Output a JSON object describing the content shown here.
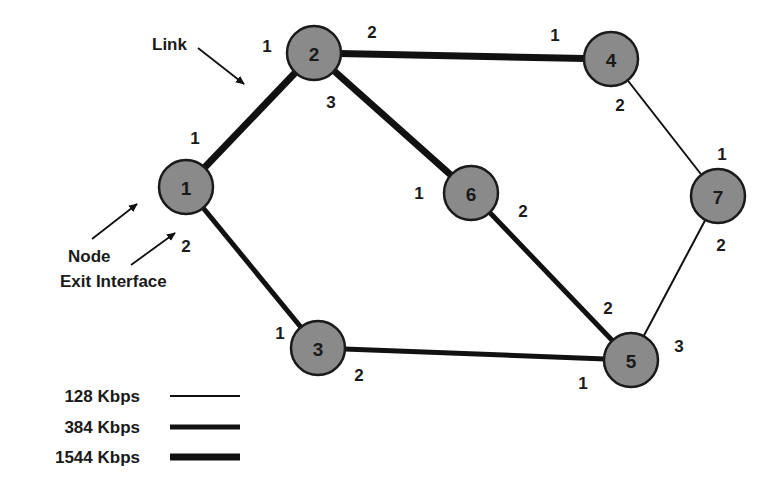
{
  "diagram": {
    "type": "network-topology",
    "nodes": [
      {
        "id": "1",
        "label": "1",
        "x": 186,
        "y": 187
      },
      {
        "id": "2",
        "label": "2",
        "x": 314,
        "y": 53
      },
      {
        "id": "3",
        "label": "3",
        "x": 318,
        "y": 348
      },
      {
        "id": "4",
        "label": "4",
        "x": 611,
        "y": 59
      },
      {
        "id": "5",
        "label": "5",
        "x": 631,
        "y": 360
      },
      {
        "id": "6",
        "label": "6",
        "x": 471,
        "y": 193
      },
      {
        "id": "7",
        "label": "7",
        "x": 718,
        "y": 196
      }
    ],
    "node_radius": 27,
    "node_fill": "#8a8a8a",
    "links": [
      {
        "from": "1",
        "to": "2",
        "bandwidth": "1544 Kbps",
        "width": 7
      },
      {
        "from": "2",
        "to": "4",
        "bandwidth": "1544 Kbps",
        "width": 7
      },
      {
        "from": "2",
        "to": "6",
        "bandwidth": "1544 Kbps",
        "width": 7
      },
      {
        "from": "1",
        "to": "3",
        "bandwidth": "384 Kbps",
        "width": 5
      },
      {
        "from": "3",
        "to": "5",
        "bandwidth": "384 Kbps",
        "width": 5
      },
      {
        "from": "6",
        "to": "5",
        "bandwidth": "384 Kbps",
        "width": 5
      },
      {
        "from": "4",
        "to": "7",
        "bandwidth": "128 Kbps",
        "width": 2
      },
      {
        "from": "7",
        "to": "5",
        "bandwidth": "128 Kbps",
        "width": 2
      }
    ],
    "interfaces": [
      {
        "node": "1",
        "label": "1",
        "x": 195,
        "y": 138
      },
      {
        "node": "1",
        "label": "2",
        "x": 186,
        "y": 246
      },
      {
        "node": "2",
        "label": "1",
        "x": 267,
        "y": 46
      },
      {
        "node": "2",
        "label": "2",
        "x": 372,
        "y": 32
      },
      {
        "node": "2",
        "label": "3",
        "x": 331,
        "y": 102
      },
      {
        "node": "4",
        "label": "1",
        "x": 555,
        "y": 35
      },
      {
        "node": "4",
        "label": "2",
        "x": 620,
        "y": 105
      },
      {
        "node": "6",
        "label": "1",
        "x": 419,
        "y": 193
      },
      {
        "node": "6",
        "label": "2",
        "x": 523,
        "y": 211
      },
      {
        "node": "7",
        "label": "1",
        "x": 722,
        "y": 154
      },
      {
        "node": "7",
        "label": "2",
        "x": 721,
        "y": 245
      },
      {
        "node": "3",
        "label": "1",
        "x": 280,
        "y": 333
      },
      {
        "node": "3",
        "label": "2",
        "x": 359,
        "y": 375
      },
      {
        "node": "5",
        "label": "1",
        "x": 583,
        "y": 383
      },
      {
        "node": "5",
        "label": "2",
        "x": 608,
        "y": 308
      },
      {
        "node": "5",
        "label": "3",
        "x": 679,
        "y": 346
      }
    ],
    "annotations": [
      {
        "label": "Link",
        "x": 152,
        "y": 50
      },
      {
        "label": "Node",
        "x": 68,
        "y": 256
      },
      {
        "label": "Exit Interface",
        "x": 60,
        "y": 281
      }
    ]
  },
  "legend": {
    "items": [
      {
        "label": "128 Kbps",
        "y": 396,
        "width": 2
      },
      {
        "label": "384 Kbps",
        "y": 427,
        "width": 5
      },
      {
        "label": "1544 Kbps",
        "y": 457,
        "width": 7
      }
    ],
    "line_x1": 170,
    "line_x2": 240,
    "text_x": 140
  }
}
